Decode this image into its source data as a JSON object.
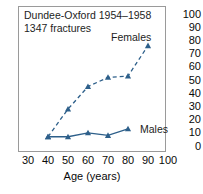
{
  "chart_data": {
    "type": "line",
    "title": "",
    "annotation_lines": [
      "Dundee-Oxford 1954–1958",
      "1347 fractures"
    ],
    "xlabel": "Age (years)",
    "ylabel": "",
    "xlim": [
      25,
      105
    ],
    "ylim": [
      0,
      100
    ],
    "xticks": [
      30,
      40,
      50,
      60,
      70,
      80,
      90,
      100
    ],
    "yticks": [
      0,
      10,
      20,
      30,
      40,
      50,
      60,
      70,
      80,
      90,
      100
    ],
    "ytick_side": "right",
    "grid": false,
    "legend": "inline-labels",
    "marker": "triangle",
    "series": [
      {
        "name": "Females",
        "linestyle": "dashed",
        "color": "#2d5f8a",
        "x": [
          40,
          50,
          60,
          70,
          80,
          90
        ],
        "values": [
          7,
          28,
          45,
          52,
          53,
          76
        ]
      },
      {
        "name": "Males",
        "linestyle": "solid",
        "color": "#2d5f8a",
        "x": [
          40,
          50,
          60,
          70,
          80
        ],
        "values": [
          7,
          7,
          10,
          8,
          13
        ]
      }
    ]
  },
  "labels": {
    "females": "Females",
    "males": "Males"
  },
  "axis": {
    "x_title": "Age (years)",
    "x_ticks": [
      "30",
      "40",
      "50",
      "60",
      "70",
      "80",
      "90",
      "100"
    ],
    "y_ticks": [
      "100",
      "90",
      "80",
      "70",
      "60",
      "50",
      "40",
      "30",
      "20",
      "10",
      "0"
    ]
  },
  "annotation": {
    "line1": "Dundee-Oxford 1954–1958",
    "line2": "1347 fractures"
  },
  "colors": {
    "series": "#2d5f8a",
    "frame": "#9a9a9a",
    "text": "#0a0a0a",
    "background": "#ffffff"
  }
}
